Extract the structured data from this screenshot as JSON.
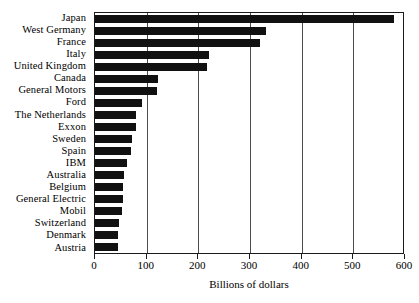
{
  "chart_data": {
    "type": "bar",
    "orientation": "horizontal",
    "title": "",
    "subtitle": "",
    "xlabel": "Billions of dollars",
    "ylabel": "",
    "xlim": [
      0,
      600
    ],
    "ylim": null,
    "grid": "vertical-gridlines-at-major-ticks",
    "legend": null,
    "legend_position": "none",
    "xticks": [
      0,
      100,
      200,
      300,
      400,
      500,
      600
    ],
    "xtick_labels": [
      "0",
      "100",
      "200",
      "300",
      "400",
      "500",
      "600"
    ],
    "categories": [
      "Japan",
      "West Germany",
      "France",
      "Italy",
      "United Kingdom",
      "Canada",
      "General Motors",
      "Ford",
      "The Netherlands",
      "Exxon",
      "Sweden",
      "Spain",
      "IBM",
      "Australia",
      "Belgium",
      "General Electric",
      "Mobil",
      "Switzerland",
      "Denmark",
      "Austria"
    ],
    "values": [
      578,
      331,
      319,
      221,
      217,
      122,
      120,
      91,
      80,
      79,
      72,
      69,
      61,
      57,
      55,
      54,
      53,
      47,
      45,
      44
    ],
    "bar_color": "#111111",
    "axis_color": "#1a1a1a",
    "gridline_color": "#4d4d4d",
    "background_color": "#ffffff"
  }
}
